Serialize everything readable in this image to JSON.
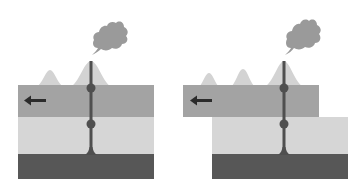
{
  "figure": {
    "panels": [
      {
        "id": "before",
        "label": "",
        "plate_motion": "left",
        "volcano_count": 2,
        "plate_offset": false
      },
      {
        "id": "after",
        "label": "",
        "plate_motion": "left",
        "volcano_count": 3,
        "plate_offset": true
      }
    ],
    "icons": {
      "arrow": "arrow-left-icon",
      "plume": "ash-plume-icon"
    },
    "colors": {
      "background": "#ffffff",
      "plate": "#a3a3a3",
      "mantle_upper": "#d6d6d6",
      "mantle_lower": "#575757",
      "conduit": "#4f4f4f",
      "volcano": "#d3d3d3",
      "plume": "#9a9a9a",
      "arrow": "#2b2b2b"
    }
  }
}
